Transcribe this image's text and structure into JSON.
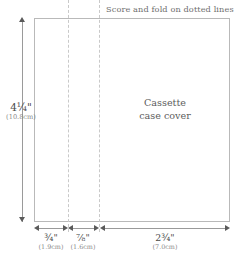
{
  "diagram": {
    "header_caption": "Score and fold on dotted lines",
    "center_label": {
      "line1": "Cassette",
      "line2": "case cover"
    },
    "vertical_dimension": {
      "inches": "4¼\"",
      "centimeters": "(10.8cm)"
    },
    "horizontal_dimensions": [
      {
        "inches": "¾\"",
        "centimeters": "(1.9cm)"
      },
      {
        "inches": "⅞\"",
        "centimeters": "(1.6cm)"
      },
      {
        "inches": "2¾\"",
        "centimeters": "(7.0cm)"
      }
    ],
    "colors": {
      "background": "#ffffff",
      "box_border": "#b9b9b9",
      "fold_line": "#c9c9c9",
      "dimension_line": "#9a9a9a",
      "arrow": "#5a5a5a",
      "text_primary": "#4a4a4a",
      "text_secondary": "#8a8a8a",
      "caption": "#6e6e6e",
      "label": "#5d5d5d"
    }
  }
}
